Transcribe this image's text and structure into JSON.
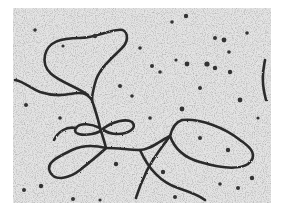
{
  "image": {
    "description": "Grayscale electron micrograph of looped DNA strands on a speckled background",
    "background_color": "#e4e4e4",
    "strand_color": "#2a2a2a",
    "speck_color": "#3a3a3a"
  }
}
